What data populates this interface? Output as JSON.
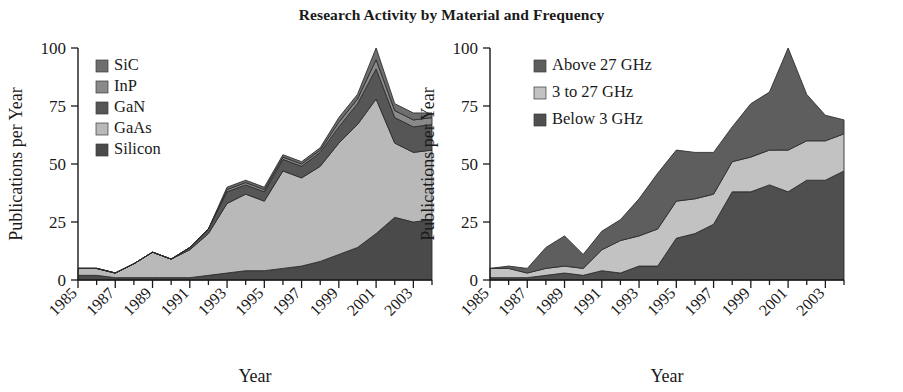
{
  "figure": {
    "title": "Research Activity by Material and Frequency",
    "width": 903,
    "height": 392
  },
  "chart_data": [
    {
      "type": "area",
      "id": "materials",
      "title": "Research Activity by Material and Frequency",
      "subtitle": "",
      "stacked": true,
      "xlabel": "Year",
      "ylabel": "Publications per Year",
      "ylim": [
        0,
        100
      ],
      "yticks": [
        0,
        25,
        50,
        75,
        100
      ],
      "ytick_labels": [
        "0",
        "25",
        "50",
        "75",
        "100"
      ],
      "xlim": [
        1985,
        2004
      ],
      "xticks": [
        1985,
        1987,
        1989,
        1991,
        1993,
        1995,
        1997,
        1999,
        2001,
        2003
      ],
      "xtick_labels": [
        "1985",
        "1987",
        "1989",
        "1991",
        "1993",
        "1995",
        "1997",
        "1999",
        "2001",
        "2003"
      ],
      "grid": false,
      "legend_position": "upper-left",
      "x": [
        1985,
        1986,
        1987,
        1988,
        1989,
        1990,
        1991,
        1992,
        1993,
        1994,
        1995,
        1996,
        1997,
        1998,
        1999,
        2000,
        2001,
        2002,
        2003,
        2004
      ],
      "series": [
        {
          "name": "Silicon",
          "color": "#4a4a4a",
          "values": [
            2,
            2,
            1,
            1,
            1,
            1,
            1,
            2,
            3,
            4,
            4,
            5,
            6,
            8,
            11,
            14,
            20,
            27,
            25,
            26
          ]
        },
        {
          "name": "GaAs",
          "color": "#b9b9b9",
          "values": [
            3,
            3,
            2,
            6,
            11,
            8,
            12,
            18,
            30,
            33,
            30,
            42,
            38,
            41,
            48,
            53,
            58,
            32,
            30,
            30
          ]
        },
        {
          "name": "GaN",
          "color": "#565656",
          "values": [
            0,
            0,
            0,
            0,
            0,
            0,
            1,
            2,
            5,
            4,
            4,
            5,
            5,
            6,
            7,
            9,
            13,
            11,
            11,
            11
          ]
        },
        {
          "name": "InP",
          "color": "#8a8a8a",
          "values": [
            0,
            0,
            0,
            0,
            0,
            0,
            0,
            0,
            1,
            1,
            1,
            1,
            1,
            1,
            2,
            2,
            4,
            3,
            3,
            3
          ]
        },
        {
          "name": "SiC",
          "color": "#6e6e6e",
          "values": [
            0,
            0,
            0,
            0,
            0,
            0,
            0,
            0,
            1,
            1,
            1,
            1,
            1,
            1,
            2,
            2,
            5,
            3,
            3,
            2
          ]
        }
      ],
      "legend": [
        {
          "label": "SiC",
          "color": "#6e6e6e"
        },
        {
          "label": "InP",
          "color": "#8a8a8a"
        },
        {
          "label": "GaN",
          "color": "#565656"
        },
        {
          "label": "GaAs",
          "color": "#b9b9b9"
        },
        {
          "label": "Silicon",
          "color": "#4a4a4a"
        }
      ]
    },
    {
      "type": "area",
      "id": "frequency",
      "title": "",
      "subtitle": "",
      "stacked": true,
      "xlabel": "Year",
      "ylabel": "Publications per Year",
      "ylim": [
        0,
        100
      ],
      "yticks": [
        0,
        25,
        50,
        75,
        100
      ],
      "ytick_labels": [
        "0",
        "25",
        "50",
        "75",
        "100"
      ],
      "xlim": [
        1985,
        2004
      ],
      "xticks": [
        1985,
        1987,
        1989,
        1991,
        1993,
        1995,
        1997,
        1999,
        2001,
        2003
      ],
      "xtick_labels": [
        "1985",
        "1987",
        "1989",
        "1991",
        "1993",
        "1995",
        "1997",
        "1999",
        "2001",
        "2003"
      ],
      "grid": false,
      "legend_position": "upper-left",
      "x": [
        1985,
        1986,
        1987,
        1988,
        1989,
        1990,
        1991,
        1992,
        1993,
        1994,
        1995,
        1996,
        1997,
        1998,
        1999,
        2000,
        2001,
        2002,
        2003,
        2004
      ],
      "series": [
        {
          "name": "Below 3 GHz",
          "color": "#4f4f4f",
          "values": [
            1,
            1,
            1,
            2,
            3,
            2,
            4,
            3,
            6,
            6,
            18,
            20,
            24,
            38,
            38,
            41,
            38,
            43,
            43,
            47
          ]
        },
        {
          "name": "3 to 27 GHz",
          "color": "#c2c2c2",
          "values": [
            4,
            4,
            2,
            3,
            3,
            3,
            9,
            14,
            13,
            16,
            16,
            15,
            13,
            13,
            15,
            15,
            18,
            17,
            17,
            16
          ]
        },
        {
          "name": "Above 27 GHz",
          "color": "#5e5e5e",
          "values": [
            0,
            1,
            2,
            9,
            13,
            6,
            8,
            9,
            16,
            24,
            22,
            20,
            18,
            15,
            23,
            25,
            44,
            20,
            11,
            6
          ]
        }
      ],
      "legend": [
        {
          "label": "Above 27 GHz",
          "color": "#5e5e5e"
        },
        {
          "label": "3 to 27 GHz",
          "color": "#c2c2c2"
        },
        {
          "label": "Below 3 GHz",
          "color": "#4f4f4f"
        }
      ]
    }
  ]
}
